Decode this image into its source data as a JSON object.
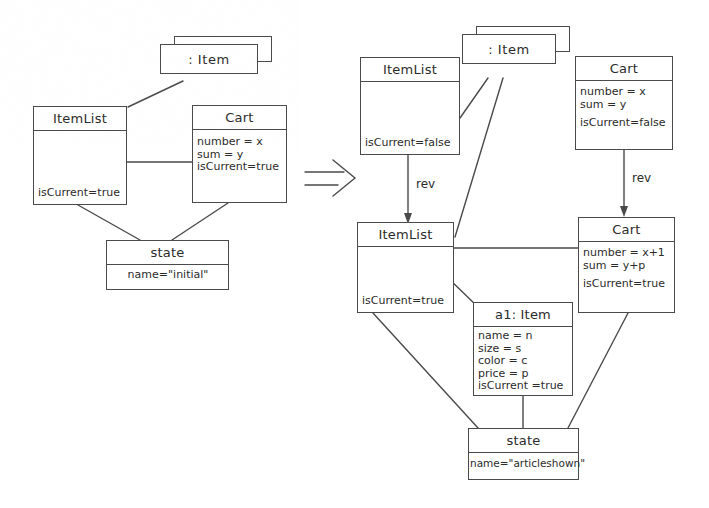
{
  "figure": {
    "type": "uml-object-diagram-transformation",
    "operator": "double-arrow-right",
    "line_color": "#4a4a4a",
    "background": "#ffffff"
  },
  "left_side": {
    "label": "left-hand side",
    "nodes": {
      "item_multi": {
        "title": ": Item",
        "stacked": true
      },
      "itemlist": {
        "title": "ItemList",
        "attrs": [
          "isCurrent=true"
        ]
      },
      "cart": {
        "title": "Cart",
        "attrs": [
          "number =  x",
          "sum =  y",
          "isCurrent=true"
        ]
      },
      "state": {
        "title": "state",
        "attrs": [
          "name=\"initial\""
        ]
      }
    }
  },
  "right_side": {
    "label": "right-hand side",
    "nodes": {
      "item_multi": {
        "title": ": Item",
        "stacked": true
      },
      "itemlist_old": {
        "title": "ItemList",
        "attrs": [
          "isCurrent=false"
        ]
      },
      "cart_old": {
        "title": "Cart",
        "attrs": [
          "number = x",
          "sum =  y",
          "isCurrent=false"
        ]
      },
      "itemlist_new": {
        "title": "ItemList",
        "attrs": [
          "isCurrent=true"
        ]
      },
      "cart_new": {
        "title": "Cart",
        "attrs": [
          "number = x+1",
          "sum = y+p",
          "isCurrent=true"
        ]
      },
      "a1_item": {
        "title": "a1: Item",
        "attrs": [
          "name = n",
          "size = s",
          "color = c",
          "price = p",
          "isCurrent =true"
        ]
      },
      "state": {
        "title": "state",
        "attrs": [
          "name=\"articleshown\""
        ]
      }
    },
    "edge_labels": {
      "rev_itemlist": "rev",
      "rev_cart": "rev"
    }
  }
}
